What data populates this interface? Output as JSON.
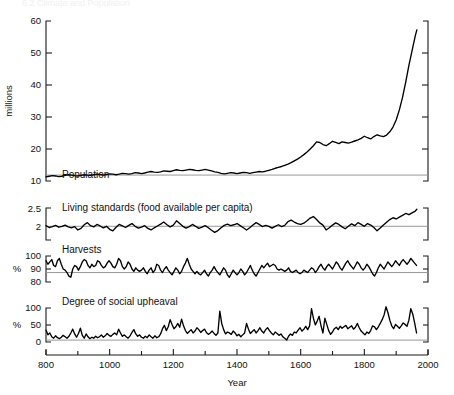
{
  "figure": {
    "cutoff_header": "6.2   Climate and Population",
    "width": 454,
    "height": 395,
    "background": "#ffffff",
    "line_color": "#000000",
    "axis_color": "#1a1a1a",
    "reference_line_color": "#8c8c8c"
  },
  "xaxis": {
    "label": "Year",
    "min": 800,
    "max": 2000,
    "major_ticks": [
      800,
      1000,
      1200,
      1400,
      1600,
      1800,
      2000
    ],
    "major_tick_labels": [
      "800",
      "1000",
      "1200",
      "1400",
      "1600",
      "1800",
      "2000"
    ],
    "minor_ticks": [
      900,
      1100,
      1300,
      1500,
      1700,
      1900
    ]
  },
  "chart_data": [
    {
      "type": "line",
      "panel": "population",
      "title": "Population",
      "series_label": "Population",
      "xlabel": "Year",
      "ylabel": "millions",
      "ylim": [
        8,
        62
      ],
      "yticks": [
        10,
        20,
        30,
        40,
        50,
        60
      ],
      "ytick_labels": [
        "10",
        "20",
        "30",
        "40",
        "50",
        "60"
      ],
      "reference_lines": [
        10
      ],
      "grid": false,
      "x": [
        800,
        810,
        820,
        830,
        840,
        850,
        860,
        870,
        880,
        890,
        900,
        910,
        920,
        930,
        940,
        950,
        960,
        970,
        980,
        990,
        1000,
        1010,
        1020,
        1030,
        1040,
        1050,
        1060,
        1070,
        1080,
        1090,
        1100,
        1110,
        1120,
        1130,
        1140,
        1150,
        1160,
        1170,
        1180,
        1190,
        1200,
        1210,
        1220,
        1230,
        1240,
        1250,
        1260,
        1270,
        1280,
        1290,
        1300,
        1310,
        1320,
        1330,
        1340,
        1350,
        1360,
        1370,
        1380,
        1390,
        1400,
        1410,
        1420,
        1430,
        1440,
        1450,
        1460,
        1470,
        1480,
        1490,
        1500,
        1510,
        1520,
        1530,
        1540,
        1550,
        1560,
        1570,
        1580,
        1590,
        1600,
        1610,
        1620,
        1630,
        1640,
        1650,
        1660,
        1670,
        1680,
        1690,
        1700,
        1710,
        1720,
        1730,
        1740,
        1750,
        1760,
        1770,
        1780,
        1790,
        1800,
        1810,
        1820,
        1830,
        1840,
        1850,
        1860,
        1870,
        1880,
        1890,
        1900,
        1910,
        1920,
        1930,
        1940,
        1950,
        1960,
        1965
      ],
      "values": [
        9.4,
        9.6,
        9.8,
        9.7,
        9.5,
        9.6,
        9.9,
        10.1,
        10.0,
        9.8,
        9.7,
        9.9,
        10.1,
        10.0,
        9.9,
        10.1,
        10.3,
        10.2,
        10.0,
        10.2,
        10.4,
        10.3,
        10.1,
        10.3,
        10.6,
        10.5,
        10.3,
        10.5,
        10.8,
        10.7,
        10.5,
        10.7,
        11.0,
        11.2,
        11.0,
        10.9,
        11.1,
        11.4,
        11.3,
        11.2,
        11.5,
        11.8,
        11.6,
        11.5,
        11.7,
        11.9,
        11.8,
        11.6,
        11.5,
        11.7,
        11.9,
        11.7,
        11.4,
        11.1,
        10.9,
        10.6,
        10.4,
        10.6,
        10.8,
        10.7,
        10.5,
        10.7,
        10.9,
        10.8,
        10.6,
        10.8,
        11.0,
        11.2,
        11.1,
        11.3,
        11.6,
        11.9,
        12.3,
        12.6,
        12.9,
        13.3,
        13.7,
        14.2,
        14.8,
        15.4,
        16.1,
        16.9,
        17.8,
        18.8,
        19.9,
        21.2,
        21.0,
        20.3,
        19.9,
        20.6,
        21.4,
        21.0,
        20.6,
        21.2,
        21.0,
        20.8,
        21.1,
        21.5,
        21.9,
        22.4,
        23.1,
        22.6,
        22.2,
        23.0,
        23.6,
        23.2,
        23.0,
        23.5,
        24.6,
        26.2,
        28.6,
        32.0,
        36.2,
        41.4,
        47.0,
        52.0,
        57.0,
        59.0
      ]
    },
    {
      "type": "line",
      "panel": "living-standards",
      "title": "Living standards (food available per capita)",
      "series_label": "Living standards (food available per capita)",
      "ylabel": "",
      "ylim": [
        1.55,
        2.6
      ],
      "yticks": [
        2,
        2.5
      ],
      "ytick_labels": [
        "2",
        "2.5"
      ],
      "reference_lines": [
        2
      ],
      "grid": false,
      "x": [
        800,
        810,
        820,
        830,
        840,
        850,
        860,
        870,
        880,
        890,
        900,
        910,
        920,
        930,
        940,
        950,
        960,
        970,
        980,
        990,
        1000,
        1010,
        1020,
        1030,
        1040,
        1050,
        1060,
        1070,
        1080,
        1090,
        1100,
        1110,
        1120,
        1130,
        1140,
        1150,
        1160,
        1170,
        1180,
        1190,
        1200,
        1210,
        1220,
        1230,
        1240,
        1250,
        1260,
        1270,
        1280,
        1290,
        1300,
        1310,
        1320,
        1330,
        1340,
        1350,
        1360,
        1370,
        1380,
        1390,
        1400,
        1410,
        1420,
        1430,
        1440,
        1450,
        1460,
        1470,
        1480,
        1490,
        1500,
        1510,
        1520,
        1530,
        1540,
        1550,
        1560,
        1570,
        1580,
        1590,
        1600,
        1610,
        1620,
        1630,
        1640,
        1650,
        1660,
        1670,
        1680,
        1690,
        1700,
        1710,
        1720,
        1730,
        1740,
        1750,
        1760,
        1770,
        1780,
        1790,
        1800,
        1810,
        1820,
        1830,
        1840,
        1850,
        1860,
        1870,
        1880,
        1890,
        1900,
        1910,
        1920,
        1930,
        1940,
        1950,
        1960,
        1965
      ],
      "values": [
        2.02,
        1.96,
        1.99,
        2.03,
        1.97,
        2.0,
        2.04,
        1.98,
        1.95,
        1.99,
        1.88,
        1.93,
        2.05,
        2.12,
        2.02,
        1.98,
        2.06,
        2.01,
        1.95,
        2.0,
        1.9,
        1.85,
        1.97,
        2.06,
        2.01,
        1.96,
        2.03,
        2.09,
        2.0,
        1.94,
        1.97,
        2.02,
        1.93,
        1.88,
        1.95,
        2.01,
        2.07,
        2.14,
        2.05,
        1.98,
        2.04,
        2.18,
        2.09,
        2.0,
        1.94,
        1.99,
        2.06,
        2.0,
        1.93,
        1.97,
        2.02,
        1.95,
        1.87,
        1.8,
        1.86,
        1.95,
        2.03,
        2.07,
        2.02,
        2.05,
        2.09,
        2.02,
        1.95,
        1.88,
        1.95,
        2.04,
        2.12,
        2.06,
        1.99,
        2.03,
        2.0,
        1.94,
        2.0,
        2.05,
        1.99,
        2.03,
        2.15,
        2.2,
        2.14,
        2.09,
        2.06,
        2.1,
        2.18,
        2.27,
        2.32,
        2.22,
        2.11,
        2.04,
        1.88,
        1.95,
        2.04,
        2.11,
        2.06,
        1.98,
        1.92,
        2.0,
        2.08,
        2.02,
        2.12,
        2.06,
        2.0,
        2.09,
        2.04,
        1.96,
        1.85,
        1.94,
        2.04,
        2.13,
        2.22,
        2.28,
        2.24,
        2.3,
        2.36,
        2.42,
        2.38,
        2.44,
        2.5,
        2.56
      ]
    },
    {
      "type": "line",
      "panel": "harvests",
      "title": "Harvests",
      "series_label": "Harvests",
      "ylabel": "%",
      "ylim": [
        82,
        104
      ],
      "yticks": [
        80,
        90,
        100
      ],
      "ytick_labels": [
        "80",
        "90",
        "100"
      ],
      "reference_lines": [
        90
      ],
      "grid": false,
      "x": [
        800,
        806,
        812,
        818,
        824,
        830,
        836,
        842,
        848,
        854,
        860,
        866,
        872,
        878,
        884,
        890,
        896,
        902,
        908,
        914,
        920,
        926,
        932,
        938,
        944,
        950,
        956,
        962,
        968,
        974,
        980,
        986,
        992,
        998,
        1004,
        1010,
        1016,
        1022,
        1028,
        1034,
        1040,
        1046,
        1052,
        1058,
        1064,
        1070,
        1076,
        1082,
        1088,
        1094,
        1100,
        1106,
        1112,
        1118,
        1124,
        1130,
        1136,
        1142,
        1148,
        1154,
        1160,
        1166,
        1172,
        1178,
        1184,
        1190,
        1196,
        1202,
        1208,
        1214,
        1220,
        1226,
        1232,
        1238,
        1244,
        1250,
        1256,
        1262,
        1268,
        1274,
        1280,
        1286,
        1292,
        1298,
        1304,
        1310,
        1316,
        1322,
        1328,
        1334,
        1340,
        1346,
        1352,
        1358,
        1364,
        1370,
        1376,
        1382,
        1388,
        1394,
        1400,
        1406,
        1412,
        1418,
        1424,
        1430,
        1436,
        1442,
        1448,
        1454,
        1460,
        1466,
        1472,
        1478,
        1484,
        1490,
        1496,
        1502,
        1508,
        1514,
        1520,
        1526,
        1532,
        1538,
        1544,
        1550,
        1556,
        1562,
        1568,
        1574,
        1580,
        1586,
        1592,
        1598,
        1604,
        1610,
        1616,
        1622,
        1628,
        1634,
        1640,
        1646,
        1652,
        1658,
        1664,
        1670,
        1676,
        1682,
        1688,
        1694,
        1700,
        1706,
        1712,
        1718,
        1724,
        1730,
        1736,
        1742,
        1748,
        1754,
        1760,
        1766,
        1772,
        1778,
        1784,
        1790,
        1796,
        1802,
        1808,
        1814,
        1820,
        1826,
        1832,
        1838,
        1844,
        1850,
        1856,
        1862,
        1868,
        1874,
        1880,
        1886,
        1892,
        1898,
        1904,
        1910,
        1916,
        1922,
        1928,
        1934,
        1940,
        1946,
        1952,
        1958,
        1964
      ],
      "values": [
        100,
        97,
        99,
        101,
        96,
        95,
        100,
        102,
        97,
        93,
        92,
        90,
        87,
        86,
        93,
        96,
        95,
        92,
        95,
        99,
        101,
        100,
        96,
        94,
        97,
        95,
        96,
        100,
        99,
        96,
        94,
        95,
        98,
        100,
        98,
        95,
        94,
        97,
        102,
        100,
        95,
        93,
        95,
        99,
        97,
        93,
        91,
        94,
        92,
        91,
        92,
        94,
        91,
        89,
        92,
        94,
        90,
        92,
        97,
        96,
        92,
        90,
        93,
        95,
        92,
        90,
        88,
        91,
        94,
        92,
        89,
        91,
        95,
        98,
        102,
        97,
        93,
        91,
        89,
        91,
        89,
        88,
        90,
        92,
        89,
        87,
        90,
        92,
        95,
        92,
        90,
        88,
        91,
        94,
        92,
        88,
        86,
        89,
        92,
        90,
        88,
        90,
        93,
        91,
        88,
        90,
        93,
        96,
        92,
        89,
        87,
        90,
        93,
        96,
        94,
        96,
        98,
        95,
        96,
        97,
        96,
        93,
        92,
        93,
        92,
        91,
        92,
        94,
        91,
        90,
        91,
        92,
        90,
        89,
        90,
        92,
        91,
        90,
        92,
        94,
        93,
        90,
        92,
        95,
        97,
        94,
        92,
        95,
        97,
        95,
        93,
        96,
        99,
        97,
        94,
        92,
        95,
        98,
        100,
        97,
        95,
        93,
        96,
        99,
        97,
        94,
        92,
        94,
        97,
        95,
        92,
        89,
        87,
        90,
        94,
        97,
        95,
        93,
        96,
        99,
        97,
        95,
        97,
        100,
        98,
        96,
        99,
        101,
        99,
        97,
        99,
        102,
        100,
        98,
        96
      ]
    },
    {
      "type": "line",
      "panel": "social-upheaval",
      "title": "Degree of social upheaval",
      "series_label": "Degree of social upheaval",
      "ylabel": "%",
      "ylim": [
        -8,
        135
      ],
      "yticks": [
        0,
        50,
        100
      ],
      "ytick_labels": [
        "0",
        "50",
        "100"
      ],
      "reference_lines": [
        0
      ],
      "grid": false,
      "x": [
        800,
        806,
        812,
        818,
        824,
        830,
        836,
        842,
        848,
        854,
        860,
        866,
        872,
        878,
        884,
        890,
        896,
        902,
        908,
        914,
        920,
        926,
        932,
        938,
        944,
        950,
        956,
        962,
        968,
        974,
        980,
        986,
        992,
        998,
        1004,
        1010,
        1016,
        1022,
        1028,
        1034,
        1040,
        1046,
        1052,
        1058,
        1064,
        1070,
        1076,
        1082,
        1088,
        1094,
        1100,
        1106,
        1112,
        1118,
        1124,
        1130,
        1136,
        1142,
        1148,
        1154,
        1160,
        1166,
        1172,
        1178,
        1184,
        1190,
        1196,
        1202,
        1208,
        1214,
        1220,
        1226,
        1232,
        1238,
        1244,
        1250,
        1256,
        1262,
        1268,
        1274,
        1280,
        1286,
        1292,
        1298,
        1304,
        1310,
        1316,
        1322,
        1328,
        1334,
        1340,
        1346,
        1352,
        1358,
        1364,
        1370,
        1376,
        1382,
        1388,
        1394,
        1400,
        1406,
        1412,
        1418,
        1424,
        1430,
        1436,
        1442,
        1448,
        1454,
        1460,
        1466,
        1472,
        1478,
        1484,
        1490,
        1496,
        1502,
        1508,
        1514,
        1520,
        1526,
        1532,
        1538,
        1544,
        1550,
        1556,
        1562,
        1568,
        1574,
        1580,
        1586,
        1592,
        1598,
        1604,
        1610,
        1616,
        1622,
        1628,
        1634,
        1640,
        1646,
        1652,
        1658,
        1664,
        1670,
        1676,
        1682,
        1688,
        1694,
        1700,
        1706,
        1712,
        1718,
        1724,
        1730,
        1736,
        1742,
        1748,
        1754,
        1760,
        1766,
        1772,
        1778,
        1784,
        1790,
        1796,
        1802,
        1808,
        1814,
        1820,
        1826,
        1832,
        1838,
        1844,
        1850,
        1856,
        1862,
        1868,
        1874,
        1880,
        1886,
        1892,
        1898,
        1904,
        1910,
        1916,
        1922,
        1928,
        1934,
        1940,
        1946,
        1952,
        1958,
        1964
      ],
      "values": [
        42,
        22,
        30,
        14,
        8,
        18,
        10,
        6,
        12,
        20,
        14,
        8,
        16,
        30,
        46,
        26,
        12,
        28,
        50,
        20,
        8,
        26,
        14,
        6,
        12,
        8,
        16,
        10,
        14,
        22,
        12,
        18,
        28,
        20,
        16,
        24,
        30,
        22,
        46,
        30,
        16,
        22,
        14,
        8,
        18,
        32,
        44,
        26,
        16,
        22,
        12,
        8,
        16,
        10,
        22,
        14,
        8,
        18,
        10,
        14,
        26,
        48,
        62,
        40,
        56,
        86,
        66,
        48,
        56,
        70,
        54,
        88,
        60,
        40,
        28,
        36,
        44,
        30,
        38,
        52,
        44,
        32,
        40,
        46,
        32,
        24,
        30,
        38,
        28,
        20,
        30,
        122,
        70,
        44,
        26,
        34,
        30,
        24,
        38,
        30,
        18,
        24,
        14,
        22,
        30,
        70,
        46,
        28,
        36,
        44,
        30,
        40,
        52,
        38,
        30,
        44,
        52,
        40,
        30,
        22,
        34,
        28,
        20,
        26,
        14,
        8,
        0,
        16,
        26,
        20,
        34,
        30,
        42,
        52,
        38,
        46,
        58,
        44,
        60,
        132,
        92,
        64,
        80,
        100,
        60,
        30,
        92,
        66,
        40,
        24,
        34,
        48,
        54,
        44,
        58,
        50,
        56,
        62,
        48,
        54,
        60,
        46,
        54,
        70,
        52,
        38,
        30,
        22,
        34,
        28,
        40,
        60,
        56,
        44,
        56,
        70,
        86,
        106,
        140,
        116,
        84,
        60,
        48,
        66,
        58,
        50,
        60,
        72,
        66,
        58,
        84,
        132,
        110,
        72,
        30
      ]
    }
  ]
}
